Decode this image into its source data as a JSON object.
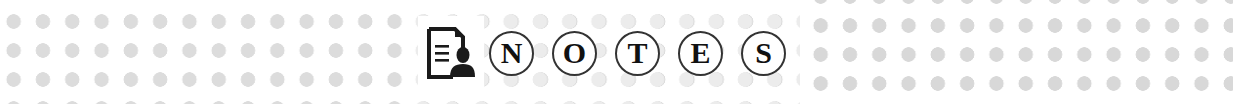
{
  "banner": {
    "icon": "document-person-icon",
    "letters": [
      "N",
      "O",
      "T",
      "E",
      "S"
    ],
    "colors": {
      "dot": "#dcdcdc",
      "ink": "#111111",
      "circle_border": "#333333",
      "background": "#ffffff"
    }
  }
}
